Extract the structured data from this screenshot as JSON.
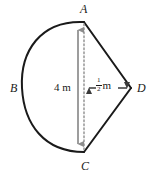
{
  "figure": {
    "background_color": "#ffffff",
    "stroke_color": "#1a1a1a",
    "dimension_color": "#8c8c8c",
    "vertices": [
      {
        "id": "A",
        "label": "A",
        "x": 84,
        "y": 22
      },
      {
        "id": "B",
        "label": "B",
        "x": 25,
        "y": 88
      },
      {
        "id": "C",
        "label": "C",
        "x": 84,
        "y": 152
      },
      {
        "id": "D",
        "label": "D",
        "x": 131,
        "y": 88
      }
    ],
    "dimensions": [
      {
        "id": "height",
        "label": "4 m",
        "value": "4",
        "unit": "m",
        "orientation": "vertical",
        "from": "A",
        "to": "C"
      },
      {
        "id": "width",
        "label": "1/2 m",
        "numerator": "1",
        "denominator": "2",
        "unit": "m",
        "orientation": "horizontal",
        "from": "AC",
        "to": "D"
      }
    ],
    "edges": [
      {
        "id": "arc-ABC",
        "type": "arc",
        "from": "A",
        "via": "B",
        "to": "C"
      },
      {
        "id": "line-AD",
        "type": "line",
        "from": "A",
        "to": "D"
      },
      {
        "id": "line-DC",
        "type": "line",
        "from": "D",
        "to": "C"
      },
      {
        "id": "line-AC",
        "type": "dashed",
        "from": "A",
        "to": "C"
      }
    ]
  }
}
